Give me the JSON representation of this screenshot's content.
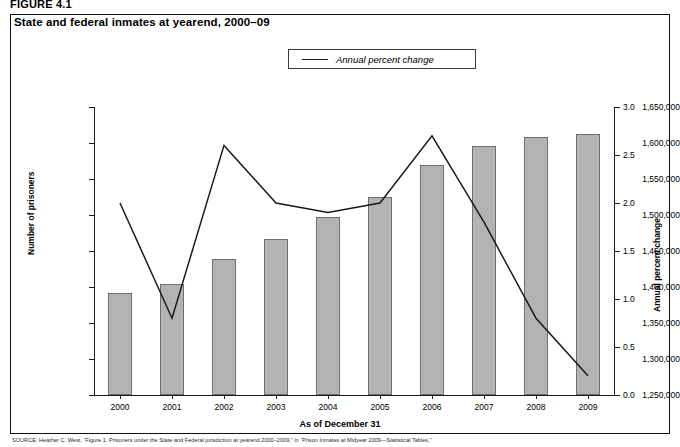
{
  "figure": {
    "label": "FIGURE 4.1",
    "title": "State and federal inmates at yearend, 2000–09"
  },
  "legend": {
    "position": "top-center",
    "entries": [
      {
        "label": "Annual percent change",
        "marker": "line",
        "color": "#1a1a1a"
      }
    ]
  },
  "axes": {
    "x_title": "As of December 31",
    "y_left_title": "Number of prisoners",
    "y_right_title": "Annual percent change"
  },
  "source": {
    "tag": "SOURCE:",
    "text": "Heather C. West, “Figure 1. Prisoners under the State and Federal jurisdiction at yearend 2000–2009,” in “Prison Inmates at Midyear 2009—Statistical Tables,”"
  },
  "chart_data": {
    "type": "bar",
    "title": "State and federal inmates at yearend, 2000–09",
    "xlabel": "As of December 31",
    "ylabel": "Number of prisoners",
    "y2label": "Annual percent change",
    "grid": false,
    "legend_position": "top-center",
    "categories": [
      "2000",
      "2001",
      "2002",
      "2003",
      "2004",
      "2005",
      "2006",
      "2007",
      "2008",
      "2009"
    ],
    "ylim": [
      1250000,
      1650000
    ],
    "y_ticks": [
      1250000,
      1300000,
      1350000,
      1400000,
      1450000,
      1500000,
      1550000,
      1600000,
      1650000
    ],
    "y_tick_labels": [
      "1,250,000",
      "1,300,000",
      "1,350,000",
      "1,400,000",
      "1,450,000",
      "1,500,000",
      "1,550,000",
      "1,600,000",
      "1,650,000"
    ],
    "y2lim": [
      0.0,
      3.0
    ],
    "y2_ticks": [
      0.0,
      0.5,
      1.0,
      1.5,
      2.0,
      2.5,
      3.0
    ],
    "y2_tick_labels": [
      "0.0",
      "0.5",
      "1.0",
      "1.5",
      "2.0",
      "2.5",
      "3.0"
    ],
    "series": [
      {
        "name": "Number of prisoners",
        "type": "bar",
        "axis": "left",
        "color": "#b3b3b3",
        "edge_color": "#6e6e6e",
        "values": [
          1391000,
          1404000,
          1439000,
          1467000,
          1497000,
          1525000,
          1569000,
          1596000,
          1609000,
          1613000
        ]
      },
      {
        "name": "Annual percent change",
        "type": "line",
        "axis": "right",
        "color": "#1a1a1a",
        "values": [
          2.0,
          0.8,
          2.6,
          2.0,
          1.9,
          2.0,
          2.7,
          1.8,
          0.8,
          0.2
        ]
      }
    ]
  }
}
